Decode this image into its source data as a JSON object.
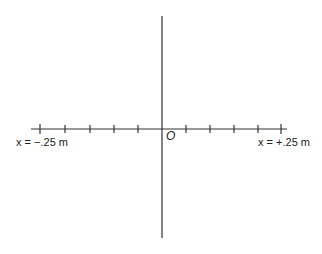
{
  "diagram": {
    "type": "coordinate-axes",
    "origin_label": "O",
    "left_end_label": "x = −.25 m",
    "right_end_label": "x = +.25 m",
    "tick_count_per_side": 5,
    "axis_color": "#333333",
    "text_color": "#222222"
  }
}
